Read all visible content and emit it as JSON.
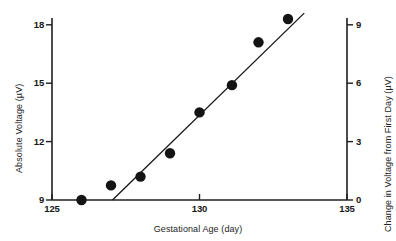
{
  "chart_data": {
    "type": "scatter",
    "title": "",
    "xlabel": "Gestational Age (day)",
    "ylabel": "Absolute Voltage (µV)",
    "y2label": "Change in Voltage from First Day (µV)",
    "xlim": [
      125,
      135
    ],
    "ylim": [
      9,
      18.9
    ],
    "y2lim": [
      0,
      9.9
    ],
    "xticks": [
      "125",
      "130",
      "135"
    ],
    "xtick_values": [
      125,
      130,
      135
    ],
    "yticks": [
      "9",
      "12",
      "15",
      "18"
    ],
    "ytick_values": [
      9,
      12,
      15,
      18
    ],
    "y2ticks": [
      "0",
      "3",
      "6",
      "9"
    ],
    "y2tick_values": [
      0,
      3,
      6,
      9
    ],
    "grid": false,
    "legend": false,
    "marker": "filled-circle",
    "marker_color": "#141414",
    "line_color": "#141414",
    "points": [
      {
        "x": 126.0,
        "y": 9.0,
        "y2": 0.0
      },
      {
        "x": 127.0,
        "y": 9.75,
        "y2": 0.75
      },
      {
        "x": 128.0,
        "y": 10.2,
        "y2": 1.2
      },
      {
        "x": 129.0,
        "y": 11.4,
        "y2": 2.4
      },
      {
        "x": 130.0,
        "y": 13.5,
        "y2": 4.5
      },
      {
        "x": 131.1,
        "y": 14.9,
        "y2": 5.9
      },
      {
        "x": 132.0,
        "y": 17.1,
        "y2": 8.1
      },
      {
        "x": 133.0,
        "y": 18.3,
        "y2": 9.3
      }
    ],
    "fit_line": {
      "type": "linear-regression",
      "x_start": 127.05,
      "y_start": 9.0,
      "x_end": 133.55,
      "y_end": 18.6
    }
  },
  "axes": {
    "x": {
      "label": "Gestational Age (day)",
      "ticks": [
        {
          "label": "125",
          "value": 125
        },
        {
          "label": "130",
          "value": 130
        },
        {
          "label": "135",
          "value": 135
        }
      ]
    },
    "y_left": {
      "label": "Absolute Voltage (µV)",
      "ticks": [
        {
          "label": "9",
          "value": 9
        },
        {
          "label": "12",
          "value": 12
        },
        {
          "label": "15",
          "value": 15
        },
        {
          "label": "18",
          "value": 18
        }
      ]
    },
    "y_right": {
      "label": "Change in Voltage from First Day (µV)",
      "ticks": [
        {
          "label": "0",
          "value": 0
        },
        {
          "label": "3",
          "value": 3
        },
        {
          "label": "6",
          "value": 6
        },
        {
          "label": "9",
          "value": 9
        }
      ]
    }
  },
  "colors": {
    "ink": "#141414",
    "axis": "#1f1f1f",
    "background": "#ffffff"
  }
}
